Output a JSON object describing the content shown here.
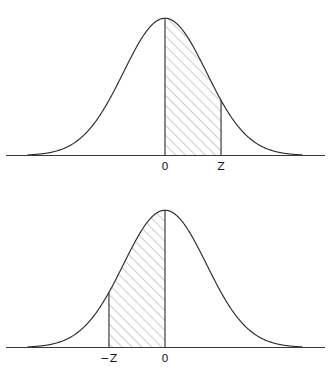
{
  "figure": {
    "title": "",
    "background_color": "#ffffff",
    "ink_color": "#2b2b2b",
    "hatch_color": "#6d6d6d",
    "panel_count": 2
  },
  "panels": [
    {
      "id": "upper-right-tail-area",
      "description": "Standard normal curve with area shaded from 0 to Z",
      "labels": {
        "center": "0",
        "bound": "Z"
      },
      "shaded_from": "0",
      "shaded_to": "Z"
    },
    {
      "id": "lower-left-area",
      "description": "Standard normal curve with area shaded from -Z to 0",
      "labels": {
        "bound": "−Z",
        "center": "0"
      },
      "shaded_from": "−Z",
      "shaded_to": "0"
    }
  ],
  "chart_data": [
    {
      "type": "area",
      "title": "",
      "subtitle": "",
      "xlabel": "",
      "ylabel": "",
      "distribution": "standard normal",
      "mean": 0,
      "sd": 1,
      "xlim": [
        -3.3,
        3.3
      ],
      "ylim": [
        0,
        0.42
      ],
      "grid": false,
      "legend": false,
      "tick_labels": [
        "0",
        "Z"
      ],
      "tick_values": [
        0,
        1.35
      ],
      "shade_interval": [
        0,
        1.35
      ],
      "shade_style": "diagonal-hatch-45",
      "boundary_lines": [
        0,
        1.35
      ],
      "x": [
        -3.3,
        -3.0,
        -2.7,
        -2.4,
        -2.1,
        -1.8,
        -1.5,
        -1.2,
        -0.9,
        -0.6,
        -0.3,
        0.0,
        0.3,
        0.6,
        0.9,
        1.2,
        1.35,
        1.5,
        1.8,
        2.1,
        2.4,
        2.7,
        3.0,
        3.3
      ],
      "y": [
        0.0017,
        0.0044,
        0.0104,
        0.0224,
        0.044,
        0.079,
        0.1295,
        0.1942,
        0.2661,
        0.3332,
        0.3814,
        0.3989,
        0.3814,
        0.3332,
        0.2661,
        0.1942,
        0.1604,
        0.1295,
        0.079,
        0.044,
        0.0224,
        0.0104,
        0.0044,
        0.0017
      ]
    },
    {
      "type": "area",
      "title": "",
      "subtitle": "",
      "xlabel": "",
      "ylabel": "",
      "distribution": "standard normal",
      "mean": 0,
      "sd": 1,
      "xlim": [
        -3.3,
        3.3
      ],
      "ylim": [
        0,
        0.42
      ],
      "grid": false,
      "legend": false,
      "tick_labels": [
        "−Z",
        "0"
      ],
      "tick_values": [
        -1.35,
        0
      ],
      "shade_interval": [
        -1.35,
        0
      ],
      "shade_style": "diagonal-hatch-45",
      "boundary_lines": [
        -1.35,
        0
      ],
      "x": [
        -3.3,
        -3.0,
        -2.7,
        -2.4,
        -2.1,
        -1.8,
        -1.5,
        -1.35,
        -1.2,
        -0.9,
        -0.6,
        -0.3,
        0.0,
        0.3,
        0.6,
        0.9,
        1.2,
        1.5,
        1.8,
        2.1,
        2.4,
        2.7,
        3.0,
        3.3
      ],
      "y": [
        0.0017,
        0.0044,
        0.0104,
        0.0224,
        0.044,
        0.079,
        0.1295,
        0.1604,
        0.1942,
        0.2661,
        0.3332,
        0.3814,
        0.3989,
        0.3814,
        0.3332,
        0.2661,
        0.1942,
        0.1295,
        0.079,
        0.044,
        0.0224,
        0.0104,
        0.0044,
        0.0017
      ]
    }
  ]
}
